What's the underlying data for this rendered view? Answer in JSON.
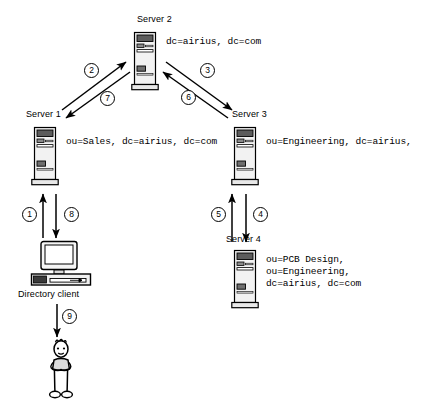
{
  "diagram": {
    "background": "#ffffff",
    "stroke": "#000000"
  },
  "nodes": [
    {
      "id": "server2",
      "label": "Server 2",
      "icon": "server-tower-icon",
      "dn_lines": [
        "dc=airius, dc=com"
      ]
    },
    {
      "id": "server1",
      "label": "Server 1",
      "icon": "server-tower-icon",
      "dn_lines": [
        "ou=Sales, dc=airius, dc=com"
      ]
    },
    {
      "id": "server3",
      "label": "Server 3",
      "icon": "server-tower-icon",
      "dn_lines": [
        "ou=Engineering, dc=airius,"
      ]
    },
    {
      "id": "server4",
      "label": "Server 4",
      "icon": "server-tower-icon",
      "dn_lines": [
        "ou=PCB Design,",
        "ou=Engineering,",
        "dc=airius, dc=com"
      ]
    },
    {
      "id": "client",
      "label": "Directory client",
      "icon": "desktop-computer-icon",
      "dn_lines": []
    },
    {
      "id": "user",
      "label": "",
      "icon": "person-stick-figure-icon",
      "dn_lines": []
    }
  ],
  "steps": [
    {
      "n": "1",
      "from": "client",
      "to": "server1"
    },
    {
      "n": "2",
      "from": "server1",
      "to": "server2"
    },
    {
      "n": "3",
      "from": "server2",
      "to": "server3"
    },
    {
      "n": "4",
      "from": "server3",
      "to": "server4"
    },
    {
      "n": "5",
      "from": "server4",
      "to": "server3"
    },
    {
      "n": "6",
      "from": "server3",
      "to": "server2"
    },
    {
      "n": "7",
      "from": "server2",
      "to": "server1"
    },
    {
      "n": "8",
      "from": "server1",
      "to": "client"
    },
    {
      "n": "9",
      "from": "client",
      "to": "user"
    }
  ]
}
